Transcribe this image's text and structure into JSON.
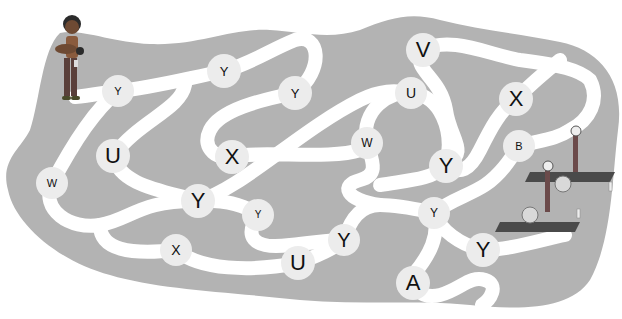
{
  "puzzle": {
    "type": "letter-maze",
    "colors": {
      "background": "#ffffff",
      "field": "#b3b3b3",
      "path": "#ffffff",
      "node": "#ececec",
      "letter": "#111111",
      "mat": "#4a4a4a"
    },
    "start": {
      "label": "girl-with-baby",
      "x": 68,
      "y": 60
    },
    "goal": {
      "label": "yoga-mats-with-people",
      "x": 565,
      "y": 200
    },
    "nodes": [
      {
        "letter": "Y",
        "x": 118,
        "y": 91,
        "size": 32,
        "font": 11
      },
      {
        "letter": "Y",
        "x": 224,
        "y": 71,
        "size": 34,
        "font": 13
      },
      {
        "letter": "Y",
        "x": 295,
        "y": 93,
        "size": 34,
        "font": 13
      },
      {
        "letter": "V",
        "x": 423,
        "y": 50,
        "size": 34,
        "font": 22
      },
      {
        "letter": "U",
        "x": 411,
        "y": 93,
        "size": 32,
        "font": 14
      },
      {
        "letter": "X",
        "x": 516,
        "y": 99,
        "size": 34,
        "font": 22
      },
      {
        "letter": "B",
        "x": 519,
        "y": 146,
        "size": 32,
        "font": 11
      },
      {
        "letter": "U",
        "x": 113,
        "y": 156,
        "size": 34,
        "font": 22
      },
      {
        "letter": "X",
        "x": 232,
        "y": 157,
        "size": 34,
        "font": 22
      },
      {
        "letter": "W",
        "x": 367,
        "y": 143,
        "size": 32,
        "font": 12
      },
      {
        "letter": "W",
        "x": 52,
        "y": 183,
        "size": 32,
        "font": 11
      },
      {
        "letter": "Y",
        "x": 198,
        "y": 201,
        "size": 34,
        "font": 22
      },
      {
        "letter": "Y",
        "x": 446,
        "y": 166,
        "size": 34,
        "font": 22
      },
      {
        "letter": "Y",
        "x": 258,
        "y": 215,
        "size": 32,
        "font": 10
      },
      {
        "letter": "Y",
        "x": 434,
        "y": 213,
        "size": 32,
        "font": 12
      },
      {
        "letter": "Y",
        "x": 344,
        "y": 240,
        "size": 32,
        "font": 20
      },
      {
        "letter": "X",
        "x": 176,
        "y": 250,
        "size": 32,
        "font": 14
      },
      {
        "letter": "U",
        "x": 298,
        "y": 263,
        "size": 34,
        "font": 22
      },
      {
        "letter": "Y",
        "x": 483,
        "y": 250,
        "size": 34,
        "font": 22
      },
      {
        "letter": "A",
        "x": 413,
        "y": 283,
        "size": 34,
        "font": 22
      }
    ]
  }
}
